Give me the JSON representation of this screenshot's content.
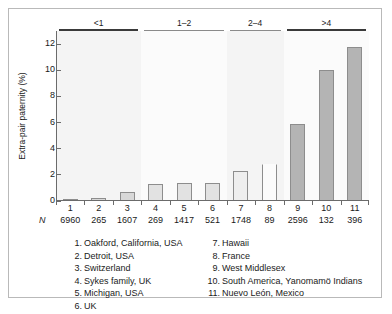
{
  "chart_data": {
    "type": "bar",
    "title": "",
    "xlabel": "",
    "ylabel": "Extra-pair paternity (%)",
    "ylim": [
      0,
      13
    ],
    "yticks": [
      0,
      2,
      4,
      6,
      8,
      10,
      12
    ],
    "grid": false,
    "legend_position": "below-axis",
    "categories": [
      "1",
      "2",
      "3",
      "4",
      "5",
      "6",
      "7",
      "8",
      "9",
      "10",
      "11"
    ],
    "values": [
      0.1,
      0.25,
      0.7,
      1.3,
      1.4,
      1.4,
      2.3,
      2.8,
      5.9,
      10.0,
      11.8
    ],
    "n_symbol": "N",
    "n_values": [
      "6960",
      "265",
      "1607",
      "269",
      "1417",
      "521",
      "1748",
      "89",
      "2596",
      "132",
      "396"
    ],
    "groups": [
      {
        "label": "<1",
        "members": [
          1,
          2,
          3
        ],
        "style": "thick"
      },
      {
        "label": "1–2",
        "members": [
          4,
          5,
          6
        ],
        "style": "thin"
      },
      {
        "label": "2–4",
        "members": [
          7,
          8
        ],
        "style": "thin"
      },
      {
        "label": ">4",
        "members": [
          9,
          10,
          11
        ],
        "style": "thick"
      }
    ],
    "annotations": [
      "Bar 8 (France) drawn as open outline with no top edge"
    ],
    "colors": {
      "group1_bar": "#d8d8d8",
      "group2_bar": "#e2e2e2",
      "group3_bar": "#eeeeee",
      "group4_bar": "#b4b4b4",
      "bar_outline": "#8d8d8d",
      "axis": "#6b6b6b",
      "band_shade": "#f4f4f4",
      "frame": "#b9b9b9",
      "text": "#1a1a1a"
    }
  },
  "legend": {
    "left_column": [
      {
        "num": "1.",
        "text": "Oakford, California, USA"
      },
      {
        "num": "2.",
        "text": "Detroit, USA"
      },
      {
        "num": "3.",
        "text": "Switzerland"
      },
      {
        "num": "4.",
        "text": "Sykes family, UK"
      },
      {
        "num": "5.",
        "text": "Michigan, USA"
      },
      {
        "num": "6.",
        "text": "UK"
      }
    ],
    "right_column": [
      {
        "num": "7.",
        "text": "Hawaii"
      },
      {
        "num": "8.",
        "text": "France"
      },
      {
        "num": "9.",
        "text": "West Middlesex"
      },
      {
        "num": "10.",
        "text": "South America, Yanomamö Indians"
      },
      {
        "num": "11.",
        "text": "Nuevo León, Mexico"
      }
    ]
  }
}
